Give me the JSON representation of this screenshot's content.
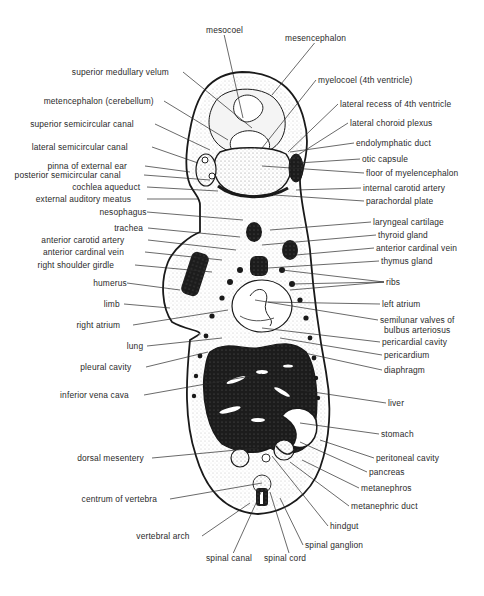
{
  "figure": {
    "colors": {
      "ink": "#1a1a1a",
      "background": "#ffffff",
      "stipple": "#9a9a9a"
    }
  },
  "labels_top": [
    {
      "id": "mesocoel",
      "text": "mesocoel",
      "x": 206,
      "y": 30,
      "tx": 243,
      "ty": 118
    },
    {
      "id": "mesencephalon",
      "text": "mesencephalon",
      "x": 285,
      "y": 38,
      "tx": 272,
      "ty": 95
    }
  ],
  "labels_left": [
    {
      "id": "superior-medullary-velum",
      "text": "superior medullary velum",
      "x": 181,
      "y": 72,
      "tx": 252,
      "ty": 128
    },
    {
      "id": "metencephalon",
      "text": "metencephalon (cerebellum)",
      "x": 162,
      "y": 101,
      "tx": 228,
      "ty": 140
    },
    {
      "id": "superior-semicircular-canal",
      "text": "superior semicircular canal",
      "x": 153,
      "y": 124,
      "tx": 210,
      "ty": 150
    },
    {
      "id": "lateral-semicircular-canal",
      "text": "lateral semicircular canal",
      "x": 150,
      "y": 147,
      "tx": 198,
      "ty": 163
    },
    {
      "id": "pinna-of-external-ear",
      "text": "pinna of external ear",
      "x": 143,
      "y": 166,
      "tx": 190,
      "ty": 172
    },
    {
      "id": "posterior-semicircular-canal",
      "text": "posterior semicircular canal",
      "x": 142,
      "y": 175,
      "tx": 210,
      "ty": 180
    },
    {
      "id": "cochlea-aqueduct",
      "text": "cochlea aqueduct",
      "x": 145,
      "y": 187,
      "tx": 218,
      "ty": 191
    },
    {
      "id": "external-auditory-meatus",
      "text": "external auditory meatus",
      "x": 145,
      "y": 199,
      "tx": 198,
      "ty": 199
    },
    {
      "id": "nesophagus",
      "text": "nesophagus",
      "x": 145,
      "y": 212,
      "tx": 243,
      "ty": 220
    },
    {
      "id": "trachea",
      "text": "trachea",
      "x": 146,
      "y": 228,
      "tx": 240,
      "ty": 237
    },
    {
      "id": "anterior-carotid-artery",
      "text": "anterior carotid artery",
      "x": 146,
      "y": 240,
      "tx": 236,
      "ty": 250
    },
    {
      "id": "anterior-cardinal-vein-left",
      "text": "anterior cardinal vein",
      "x": 143,
      "y": 252,
      "tx": 222,
      "ty": 260
    },
    {
      "id": "right-shoulder-girdle",
      "text": "right shoulder girdle",
      "x": 133,
      "y": 265,
      "tx": 212,
      "ty": 272
    },
    {
      "id": "humerus",
      "text": "humerus",
      "x": 125,
      "y": 283,
      "tx": 180,
      "ty": 290
    },
    {
      "id": "limb",
      "text": "limb",
      "x": 122,
      "y": 304,
      "tx": 170,
      "ty": 308
    },
    {
      "id": "right-atrium",
      "text": "right atrium",
      "x": 131,
      "y": 325,
      "tx": 228,
      "ty": 310
    },
    {
      "id": "lung",
      "text": "lung",
      "x": 145,
      "y": 346,
      "tx": 222,
      "ty": 338
    },
    {
      "id": "pleural-cavity",
      "text": "pleural cavity",
      "x": 144,
      "y": 367,
      "tx": 208,
      "ty": 352
    },
    {
      "id": "inferior-vena-cava",
      "text": "inferior vena cava",
      "x": 142,
      "y": 395,
      "tx": 262,
      "ty": 374
    },
    {
      "id": "dorsal-mesentery",
      "text": "dorsal mesentery",
      "x": 150,
      "y": 458,
      "tx": 258,
      "ty": 448
    },
    {
      "id": "centrum-of-vertebra",
      "text": "centrum of vertebra",
      "x": 168,
      "y": 499,
      "tx": 262,
      "ty": 483
    },
    {
      "id": "vertebral-arch",
      "text": "vertebral arch",
      "x": 200,
      "y": 536,
      "tx": 250,
      "ty": 503
    }
  ],
  "labels_right": [
    {
      "id": "myelocoel",
      "text": "myelocoel (4th ventricle)",
      "x": 318,
      "y": 80,
      "tx": 262,
      "ty": 148
    },
    {
      "id": "lateral-recess",
      "text": "lateral recess of 4th ventricle",
      "x": 340,
      "y": 104,
      "tx": 288,
      "ty": 152
    },
    {
      "id": "lateral-choroid-plexus",
      "text": "lateral choroid plexus",
      "x": 350,
      "y": 123,
      "tx": 290,
      "ty": 160
    },
    {
      "id": "endolymphatic-duct",
      "text": "endolymphatic duct",
      "x": 356,
      "y": 143,
      "tx": 290,
      "ty": 152
    },
    {
      "id": "otic-capsule",
      "text": "otic capsule",
      "x": 362,
      "y": 159,
      "tx": 298,
      "ty": 163
    },
    {
      "id": "floor-of-myelencephalon",
      "text": "floor of myelencephalon",
      "x": 366,
      "y": 173,
      "tx": 262,
      "ty": 166
    },
    {
      "id": "internal-carotid-artery",
      "text": "internal carotid artery",
      "x": 363,
      "y": 188,
      "tx": 296,
      "ty": 190
    },
    {
      "id": "parachordal-plate",
      "text": "parachordal plate",
      "x": 366,
      "y": 201,
      "tx": 274,
      "ty": 195
    },
    {
      "id": "laryngeal-cartilage",
      "text": "laryngeal cartilage",
      "x": 373,
      "y": 222,
      "tx": 270,
      "ty": 230
    },
    {
      "id": "thyroid-gland",
      "text": "thyroid gland",
      "x": 378,
      "y": 235,
      "tx": 262,
      "ty": 245
    },
    {
      "id": "anterior-cardinal-vein-right",
      "text": "anterior cardinal vein",
      "x": 376,
      "y": 248,
      "tx": 296,
      "ty": 255
    },
    {
      "id": "thymus-gland",
      "text": "thymus gland",
      "x": 381,
      "y": 261,
      "tx": 268,
      "ty": 268
    },
    {
      "id": "ribs",
      "text": "ribs",
      "x": 386,
      "y": 282,
      "tx": 290,
      "ty": 290
    },
    {
      "id": "left-atrium",
      "text": "left atrium",
      "x": 382,
      "y": 304,
      "tx": 268,
      "ty": 302
    },
    {
      "id": "semilunar-valves-1",
      "text": "semilunar valves of",
      "x": 380,
      "y": 320,
      "tx": 255,
      "ty": 300
    },
    {
      "id": "semilunar-valves-2",
      "text": "bulbus arteriosus",
      "x": 384,
      "y": 330,
      "tx": 0,
      "ty": 0
    },
    {
      "id": "pericardial-cavity",
      "text": "pericardial cavity",
      "x": 382,
      "y": 342,
      "tx": 262,
      "ty": 328
    },
    {
      "id": "pericardium",
      "text": "pericardium",
      "x": 384,
      "y": 355,
      "tx": 280,
      "ty": 338
    },
    {
      "id": "diaphragm",
      "text": "diaphragm",
      "x": 384,
      "y": 370,
      "tx": 300,
      "ty": 352
    },
    {
      "id": "liver",
      "text": "liver",
      "x": 388,
      "y": 403,
      "tx": 300,
      "ty": 390
    },
    {
      "id": "stomach",
      "text": "stomach",
      "x": 381,
      "y": 434,
      "tx": 300,
      "ty": 423
    },
    {
      "id": "peritoneal-cavity",
      "text": "peritoneal cavity",
      "x": 376,
      "y": 458,
      "tx": 320,
      "ty": 440
    },
    {
      "id": "pancreas",
      "text": "pancreas",
      "x": 369,
      "y": 472,
      "tx": 300,
      "ty": 442
    },
    {
      "id": "metanephros",
      "text": "metanephros",
      "x": 361,
      "y": 488,
      "tx": 302,
      "ty": 460
    },
    {
      "id": "metanephric-duct",
      "text": "metanephric duct",
      "x": 351,
      "y": 506,
      "tx": 290,
      "ty": 462
    },
    {
      "id": "hindgut",
      "text": "hindgut",
      "x": 330,
      "y": 526,
      "tx": 272,
      "ty": 456
    },
    {
      "id": "spinal-ganglion",
      "text": "spinal ganglion",
      "x": 305,
      "y": 545,
      "tx": 280,
      "ty": 498
    }
  ],
  "labels_bottom": [
    {
      "id": "spinal-canal",
      "text": "spinal canal",
      "x": 206,
      "y": 558,
      "tx": 262,
      "ty": 490
    },
    {
      "id": "spinal-cord",
      "text": "spinal cord",
      "x": 264,
      "y": 558,
      "tx": 270,
      "ty": 492
    }
  ]
}
